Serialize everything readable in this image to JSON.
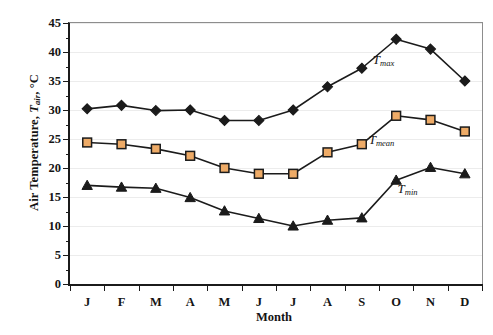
{
  "chart_data": {
    "type": "line",
    "title": "",
    "subtitle": "",
    "xlabel": "Month",
    "ylabel": "Air Temperature, T_air, °C",
    "ylabel_main": "Air Temperature,",
    "ylabel_symbol": "T",
    "ylabel_subscript": "air",
    "ylabel_unit": ", °C",
    "categories": [
      "J",
      "F",
      "M",
      "A",
      "M",
      "J",
      "J",
      "A",
      "S",
      "O",
      "N",
      "D"
    ],
    "category_names": [
      "January",
      "February",
      "March",
      "April",
      "May",
      "June",
      "July",
      "August",
      "September",
      "October",
      "November",
      "December"
    ],
    "ylim": [
      0,
      45
    ],
    "ytick_step": 5,
    "yticks": [
      0,
      5,
      10,
      15,
      20,
      25,
      30,
      35,
      40,
      45
    ],
    "ytick_labels": [
      "0",
      "5",
      "10",
      "15",
      "20",
      "25",
      "30",
      "35",
      "40",
      "45"
    ],
    "minor_ticks": true,
    "grid": true,
    "grid_axis": "y",
    "grid_color": "#ececec",
    "legend": "none",
    "legend_position": "inline-annotation",
    "series": [
      {
        "name": "Tmax",
        "label_symbol": "T",
        "label_subscript": "max",
        "marker": "diamond",
        "marker_color": "#1b1b1b",
        "line_color": "#1b1b1b",
        "values": [
          30.2,
          30.8,
          29.9,
          30.0,
          28.2,
          28.2,
          30.0,
          34.0,
          37.2,
          42.2,
          40.5,
          35.0
        ]
      },
      {
        "name": "Tmean",
        "label_symbol": "T",
        "label_subscript": "mean",
        "marker": "square",
        "marker_color": "#eeab67",
        "marker_edge": "#1b1b1b",
        "line_color": "#1b1b1b",
        "values": [
          24.4,
          24.1,
          23.3,
          22.1,
          20.0,
          19.0,
          19.0,
          22.7,
          24.1,
          29.0,
          28.3,
          26.3
        ]
      },
      {
        "name": "Tmin",
        "label_symbol": "T",
        "label_subscript": "min",
        "marker": "triangle",
        "marker_color": "#1b1b1b",
        "line_color": "#1b1b1b",
        "values": [
          17.0,
          16.7,
          16.5,
          14.9,
          12.6,
          11.3,
          10.0,
          11.0,
          11.4,
          17.9,
          20.1,
          19.0
        ]
      }
    ],
    "annotations": [
      {
        "text": "Tmax",
        "symbol": "T",
        "subscript": "max",
        "x_pct": 73.5,
        "y_value": 38.5
      },
      {
        "text": "Tmean",
        "symbol": "T",
        "subscript": "mean",
        "x_pct": 72.5,
        "y_value": 24.6
      },
      {
        "text": "Tmin",
        "symbol": "T",
        "subscript": "min",
        "x_pct": 79.5,
        "y_value": 16.2
      }
    ]
  }
}
